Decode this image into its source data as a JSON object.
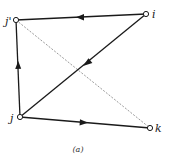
{
  "figure": {
    "caption": "(a)",
    "colors": {
      "edge": "#1a1a1a",
      "dashed_edge": "#555555",
      "node_fill": "#ffffff",
      "node_stroke": "#1a1a1a",
      "label": "#222222"
    },
    "nodes": [
      {
        "id": "j_prime",
        "label": "j'",
        "x": 16,
        "y": 20
      },
      {
        "id": "i",
        "label": "i",
        "x": 146,
        "y": 14
      },
      {
        "id": "j",
        "label": "j",
        "x": 20,
        "y": 117
      },
      {
        "id": "k",
        "label": "k",
        "x": 150,
        "y": 128
      }
    ],
    "edges": [
      {
        "from": "i",
        "to": "j_prime",
        "directed": true,
        "style": "solid"
      },
      {
        "from": "i",
        "to": "j",
        "directed": true,
        "style": "solid"
      },
      {
        "from": "j",
        "to": "j_prime",
        "directed": true,
        "style": "solid"
      },
      {
        "from": "j",
        "to": "k",
        "directed": true,
        "style": "solid"
      },
      {
        "from": "j_prime",
        "to": "k",
        "directed": false,
        "style": "dashed"
      }
    ]
  }
}
